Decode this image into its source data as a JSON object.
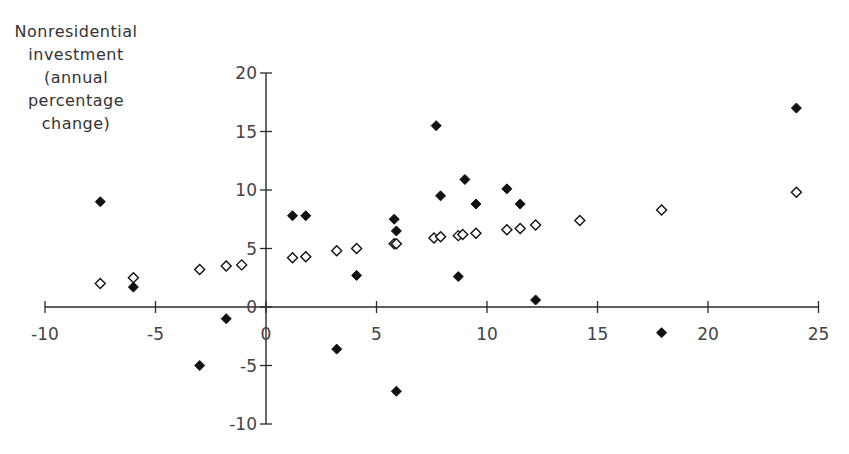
{
  "chart_data": {
    "type": "scatter",
    "title": "",
    "xlabel": "",
    "ylabel": "Nonresidential investment (annual percentage change)",
    "ylabel_lines": [
      "Nonresidential",
      "investment",
      "(annual",
      "percentage",
      "change)"
    ],
    "xlim": [
      -10,
      25
    ],
    "ylim": [
      -10,
      20
    ],
    "x_ticks": [
      -10,
      -5,
      0,
      5,
      10,
      15,
      20,
      25
    ],
    "y_ticks": [
      -10,
      -5,
      0,
      5,
      10,
      15,
      20
    ],
    "grid": false,
    "legend": "none",
    "series": [
      {
        "name": "filled-diamonds",
        "marker": "filled-diamond",
        "points": [
          [
            -7.5,
            9.0
          ],
          [
            -6.0,
            1.7
          ],
          [
            -3.0,
            -5.0
          ],
          [
            -1.8,
            -1.0
          ],
          [
            1.2,
            7.8
          ],
          [
            1.8,
            7.8
          ],
          [
            3.2,
            -3.6
          ],
          [
            4.1,
            2.7
          ],
          [
            5.8,
            7.5
          ],
          [
            5.9,
            6.5
          ],
          [
            5.9,
            -7.2
          ],
          [
            7.7,
            15.5
          ],
          [
            7.9,
            9.5
          ],
          [
            8.7,
            2.6
          ],
          [
            9.0,
            10.9
          ],
          [
            9.5,
            8.8
          ],
          [
            10.9,
            10.1
          ],
          [
            11.5,
            8.8
          ],
          [
            12.2,
            0.6
          ],
          [
            17.9,
            -2.2
          ],
          [
            24.0,
            17.0
          ]
        ]
      },
      {
        "name": "open-diamonds",
        "marker": "open-diamond",
        "points": [
          [
            -7.5,
            2.0
          ],
          [
            -6.0,
            2.5
          ],
          [
            -3.0,
            3.2
          ],
          [
            -1.8,
            3.5
          ],
          [
            -1.1,
            3.6
          ],
          [
            1.2,
            4.2
          ],
          [
            1.8,
            4.3
          ],
          [
            3.2,
            4.8
          ],
          [
            4.1,
            5.0
          ],
          [
            5.8,
            5.4
          ],
          [
            5.9,
            5.4
          ],
          [
            7.6,
            5.9
          ],
          [
            7.9,
            6.0
          ],
          [
            8.7,
            6.1
          ],
          [
            8.9,
            6.2
          ],
          [
            9.5,
            6.3
          ],
          [
            10.9,
            6.6
          ],
          [
            11.5,
            6.7
          ],
          [
            12.2,
            7.0
          ],
          [
            14.2,
            7.4
          ],
          [
            17.9,
            8.3
          ],
          [
            24.0,
            9.8
          ]
        ]
      }
    ]
  },
  "style": {
    "axis_color": "#2a2a2a",
    "marker_color": "#111111",
    "background": "#ffffff"
  }
}
